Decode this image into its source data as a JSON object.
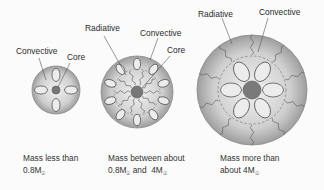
{
  "diagram": {
    "colors": {
      "star_fill": "#c9c9c9",
      "star_edge": "#8a8a8a",
      "core": "#7a7a7a",
      "line": "#555555",
      "text": "#333333"
    },
    "stars": [
      {
        "id": "low-mass",
        "labels": [
          {
            "text": "Convective"
          },
          {
            "text": "Core"
          }
        ],
        "convective_cells": 4,
        "caption_line1": "Mass less than",
        "caption_line2": "0.8M",
        "caption_sub": "☉"
      },
      {
        "id": "mid-mass",
        "labels": [
          {
            "text": "Radiative"
          },
          {
            "text": "Convective"
          },
          {
            "text": "Core"
          }
        ],
        "convective_cells": 10,
        "caption_line1": "Mass between about",
        "caption_line2a": "0.8M",
        "caption_sub_a": "☉",
        "caption_line2b": " and  4M",
        "caption_sub_b": "☉"
      },
      {
        "id": "high-mass",
        "labels": [
          {
            "text": "Radiative"
          },
          {
            "text": "Convective"
          }
        ],
        "convective_cells": 6,
        "caption_line1": "Mass more than",
        "caption_line2": "about 4M",
        "caption_sub": "☉"
      }
    ]
  }
}
